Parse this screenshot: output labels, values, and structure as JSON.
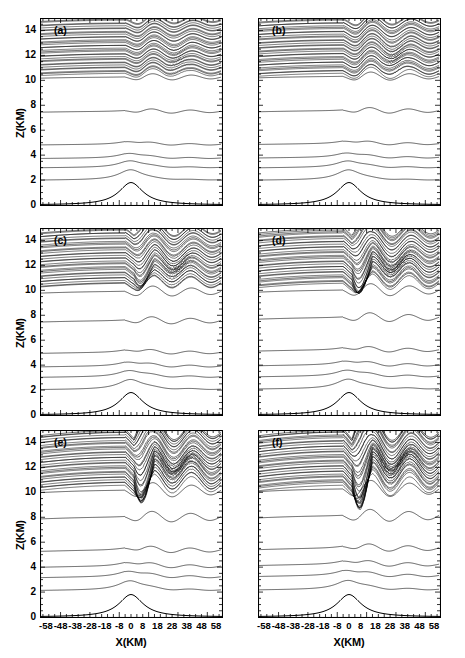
{
  "figure": {
    "title": "",
    "axis": {
      "xlabel": "X(KM)",
      "ylabel": "Z(KM)",
      "xticks": [
        "-58",
        "-48",
        "-38",
        "-28",
        "-18",
        "-8",
        "0",
        "8",
        "18",
        "28",
        "38",
        "48",
        "58"
      ],
      "xtick_values": [
        -58,
        -48,
        -38,
        -28,
        -18,
        -8,
        0,
        8,
        18,
        28,
        38,
        48,
        58
      ],
      "yticks": [
        "0",
        "2",
        "4",
        "6",
        "8",
        "10",
        "12",
        "14"
      ],
      "ytick_values": [
        0,
        2,
        4,
        6,
        8,
        10,
        12,
        14
      ],
      "xlim": [
        -62,
        62
      ],
      "ylim": [
        0,
        15
      ]
    },
    "panels": [
      {
        "id": "a",
        "label": "(a)",
        "row": 0,
        "col": 0
      },
      {
        "id": "b",
        "label": "(b)",
        "row": 0,
        "col": 1
      },
      {
        "id": "c",
        "label": "(c)",
        "row": 1,
        "col": 0
      },
      {
        "id": "d",
        "label": "(d)",
        "row": 1,
        "col": 1
      },
      {
        "id": "e",
        "label": "(e)",
        "row": 2,
        "col": 0
      },
      {
        "id": "f",
        "label": "(f)",
        "row": 2,
        "col": 1
      }
    ]
  },
  "chart_data": {
    "type": "line",
    "title": "",
    "subtitle": "",
    "xlabel": "X(KM)",
    "ylabel": "Z(KM)",
    "xlim": [
      -62,
      62
    ],
    "ylim": [
      0,
      15
    ],
    "grid": false,
    "legend": null,
    "panel_labels": [
      "(a)",
      "(b)",
      "(c)",
      "(d)",
      "(e)",
      "(f)"
    ],
    "xticks": [
      -58,
      -48,
      -38,
      -28,
      -18,
      -8,
      0,
      8,
      18,
      28,
      38,
      48,
      58
    ],
    "yticks": [
      0,
      2,
      4,
      6,
      8,
      10,
      12,
      14
    ],
    "terrain": {
      "name": "bell-shaped-mountain",
      "peak_height_km": 1.8,
      "peak_x_km": 0,
      "half_width_km": 10
    },
    "contour_interval_km": 0.45,
    "series": [
      {
        "name": "isentrope-base-heights-panel-a",
        "panel": "a",
        "values": [
          0.0,
          2.0,
          3.0,
          3.75,
          4.85,
          7.5,
          10.25,
          10.7,
          11.05,
          11.4,
          11.75,
          12.1,
          12.45,
          12.8,
          13.15,
          13.5,
          13.85,
          14.2,
          14.55,
          14.9
        ],
        "breaking_region": {
          "x_km": [
            24,
            40
          ],
          "z_km": [
            11.0,
            12.6
          ],
          "intensity": 0.45
        }
      },
      {
        "name": "isentrope-base-heights-panel-b",
        "panel": "b",
        "values": [
          0.0,
          2.0,
          3.0,
          3.8,
          4.9,
          7.55,
          10.3,
          10.75,
          11.1,
          11.45,
          11.8,
          12.15,
          12.5,
          12.85,
          13.2,
          13.55,
          13.9,
          14.25,
          14.6,
          14.9
        ],
        "breaking_region": {
          "x_km": [
            22,
            42
          ],
          "z_km": [
            11.2,
            12.8
          ],
          "intensity": 0.6
        }
      },
      {
        "name": "isentrope-base-heights-panel-c",
        "panel": "c",
        "values": [
          0.0,
          2.05,
          3.05,
          3.9,
          5.0,
          7.55,
          9.9,
          10.6,
          11.0,
          11.4,
          11.8,
          12.2,
          12.6,
          13.0,
          13.4,
          13.8,
          14.2,
          14.6,
          14.9
        ],
        "breaking_region": {
          "x_km": [
            18,
            46
          ],
          "z_km": [
            11.0,
            13.0
          ],
          "intensity": 0.75
        }
      },
      {
        "name": "isentrope-base-heights-panel-d",
        "panel": "d",
        "values": [
          0.0,
          2.1,
          3.1,
          4.0,
          5.2,
          7.8,
          10.0,
          10.7,
          11.1,
          11.5,
          11.9,
          12.3,
          12.7,
          13.1,
          13.5,
          13.9,
          14.3,
          14.7,
          14.95
        ],
        "breaking_region": {
          "x_km": [
            14,
            50
          ],
          "z_km": [
            11.0,
            13.2
          ],
          "intensity": 0.85
        }
      },
      {
        "name": "isentrope-base-heights-panel-e",
        "panel": "e",
        "values": [
          0.0,
          2.15,
          3.2,
          4.05,
          5.35,
          8.0,
          10.15,
          10.8,
          11.2,
          11.6,
          12.0,
          12.4,
          12.8,
          13.2,
          13.6,
          14.0,
          14.4,
          14.8,
          14.95
        ],
        "breaking_region": {
          "x_km": [
            10,
            54
          ],
          "z_km": [
            11.0,
            13.4
          ],
          "intensity": 0.95
        }
      },
      {
        "name": "isentrope-base-heights-panel-f",
        "panel": "f",
        "values": [
          0.0,
          2.2,
          3.3,
          4.2,
          5.5,
          8.1,
          10.25,
          10.9,
          11.3,
          11.7,
          12.1,
          12.5,
          12.9,
          13.3,
          13.7,
          14.1,
          14.5,
          14.85,
          14.98
        ],
        "breaking_region": {
          "x_km": [
            8,
            56
          ],
          "z_km": [
            11.2,
            13.6
          ],
          "intensity": 1.0
        }
      }
    ]
  }
}
